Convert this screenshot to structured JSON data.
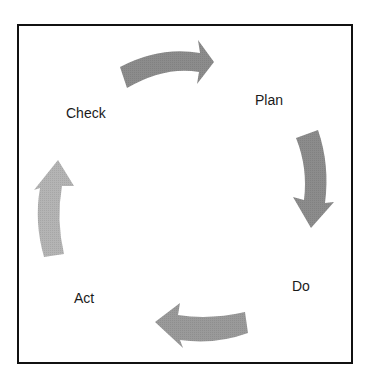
{
  "diagram": {
    "type": "cycle",
    "stages": [
      {
        "id": "plan",
        "label": "Plan"
      },
      {
        "id": "do",
        "label": "Do"
      },
      {
        "id": "act",
        "label": "Act"
      },
      {
        "id": "check",
        "label": "Check"
      }
    ],
    "arrows": [
      {
        "from": "check",
        "to": "plan",
        "direction": "right",
        "color": "#8c8c8c",
        "icon": "curved-arrow-right-icon"
      },
      {
        "from": "plan",
        "to": "do",
        "direction": "down",
        "color": "#8c8c8c",
        "icon": "curved-arrow-down-icon"
      },
      {
        "from": "do",
        "to": "act",
        "direction": "left",
        "color": "#9a9a9a",
        "icon": "curved-arrow-left-icon"
      },
      {
        "from": "act",
        "to": "check",
        "direction": "up",
        "color": "#b4b4b4",
        "icon": "curved-arrow-up-icon"
      }
    ],
    "frame_color": "#111111",
    "background": "#ffffff"
  }
}
